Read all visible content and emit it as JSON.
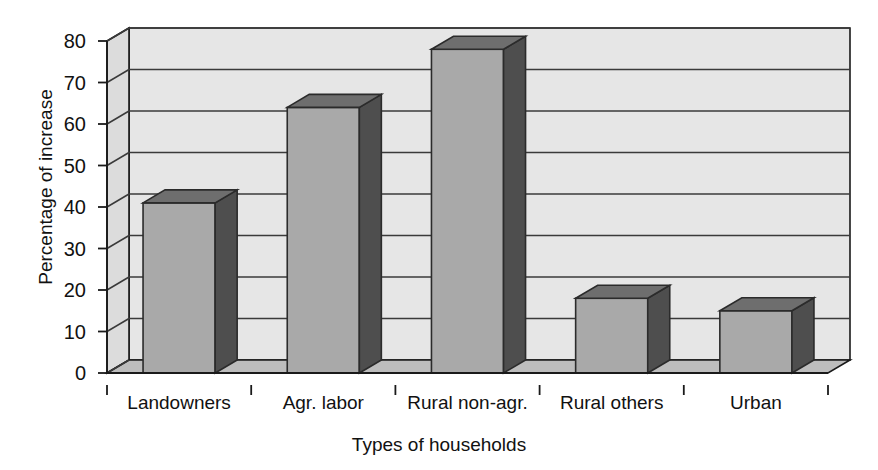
{
  "chart_data": {
    "type": "bar",
    "title": "",
    "subtitle": "",
    "xlabel": "Types of households",
    "ylabel": "Percentage of increase",
    "categories": [
      "Landowners",
      "Agr. labor",
      "Rural non-agr.",
      "Rural others",
      "Urban"
    ],
    "values": [
      41,
      64,
      78,
      18,
      15
    ],
    "series": [
      {
        "name": "Percentage of increase",
        "values": [
          41,
          64,
          78,
          18,
          15
        ]
      }
    ],
    "ylim": [
      0,
      80
    ],
    "ytick_labels": [
      "0",
      "10",
      "20",
      "30",
      "40",
      "50",
      "60",
      "70",
      "80"
    ],
    "ytick_values": [
      0,
      10,
      20,
      30,
      40,
      50,
      60,
      70,
      80
    ],
    "ytick_step": 10,
    "grid": true,
    "grid_axis": "y",
    "legend": false,
    "legend_position": "none",
    "style": "3d-column",
    "annotations": []
  },
  "colors": {
    "bar_front": "#a9a9a9",
    "bar_side": "#4e4e4e",
    "bar_top": "#6e6e6e",
    "wall_back": "#e6e6e6",
    "wall_side": "#dcdcdc",
    "floor": "#bdbdbd",
    "gridline": "#3a3a3a",
    "axis": "#1a1a1a",
    "text": "#111111",
    "background": "#ffffff"
  }
}
